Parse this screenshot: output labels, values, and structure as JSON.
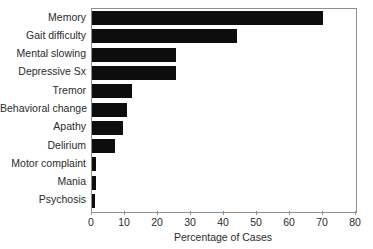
{
  "chart_data": {
    "type": "bar",
    "orientation": "horizontal",
    "title": "",
    "xlabel": "Percentage of Cases",
    "ylabel": "",
    "categories": [
      "Memory",
      "Gait difficulty",
      "Mental slowing",
      "Depressive Sx",
      "Tremor",
      "Behavioral change",
      "Apathy",
      "Delirium",
      "Motor complaint",
      "Mania",
      "Psychosis"
    ],
    "values": [
      70,
      44,
      25.5,
      25.5,
      12,
      10.5,
      9.5,
      7,
      1.2,
      1.2,
      1
    ],
    "xlim": [
      0,
      80
    ],
    "xticks": [
      0,
      10,
      20,
      30,
      40,
      50,
      60,
      70,
      80
    ],
    "xticklabels": [
      "0",
      "10",
      "20",
      "30",
      "40",
      "50",
      "60",
      "70",
      "80"
    ],
    "grid": false,
    "legend": null,
    "bar_color": "#0d0d0d",
    "frame_color": "#8f8f8f",
    "background": "#ffffff"
  }
}
